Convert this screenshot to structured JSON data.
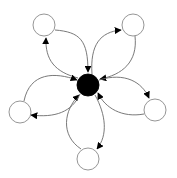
{
  "diagram": {
    "type": "hub-and-spoke directed graph",
    "canvas": {
      "width": 177,
      "height": 178,
      "background": "#ffffff"
    },
    "colors": {
      "hub_fill": "#000000",
      "node_fill": "#ffffff",
      "node_stroke": "#8a8a8a",
      "edge": "#6a6a6a",
      "arrowhead": "#000000"
    },
    "hub": {
      "id": "hub",
      "cx": 88,
      "cy": 85,
      "r": 11,
      "filled": true
    },
    "nodes": [
      {
        "id": "top-left",
        "cx": 44,
        "cy": 25,
        "r": 11
      },
      {
        "id": "top-right",
        "cx": 133,
        "cy": 25,
        "r": 11
      },
      {
        "id": "right",
        "cx": 155,
        "cy": 110,
        "r": 11
      },
      {
        "id": "bottom",
        "cx": 88,
        "cy": 159,
        "r": 11
      },
      {
        "id": "left",
        "cx": 20,
        "cy": 112,
        "r": 11
      }
    ],
    "edges": [
      {
        "from": "top-left",
        "to": "hub",
        "d": "M55,30 C80,32 88,40 88,72"
      },
      {
        "from": "hub",
        "to": "top-left",
        "d": "M78,78 C55,72 45,60 46,38"
      },
      {
        "from": "hub",
        "to": "top-right",
        "d": "M92,74 C90,45 100,32 121,30"
      },
      {
        "from": "top-right",
        "to": "hub",
        "d": "M135,36 C138,62 122,75 100,79"
      },
      {
        "from": "hub",
        "to": "right",
        "d": "M99,80 C125,72 142,82 149,98"
      },
      {
        "from": "right",
        "to": "hub",
        "d": "M144,114 C122,118 105,108 98,93"
      },
      {
        "from": "hub",
        "to": "bottom",
        "d": "M95,95 C106,115 108,135 97,149"
      },
      {
        "from": "bottom",
        "to": "hub",
        "d": "M81,149 C60,135 64,110 79,95"
      },
      {
        "from": "hub",
        "to": "left",
        "d": "M80,94 C72,112 55,118 31,115"
      },
      {
        "from": "left",
        "to": "hub",
        "d": "M24,101 C30,72 55,72 77,80"
      }
    ]
  }
}
